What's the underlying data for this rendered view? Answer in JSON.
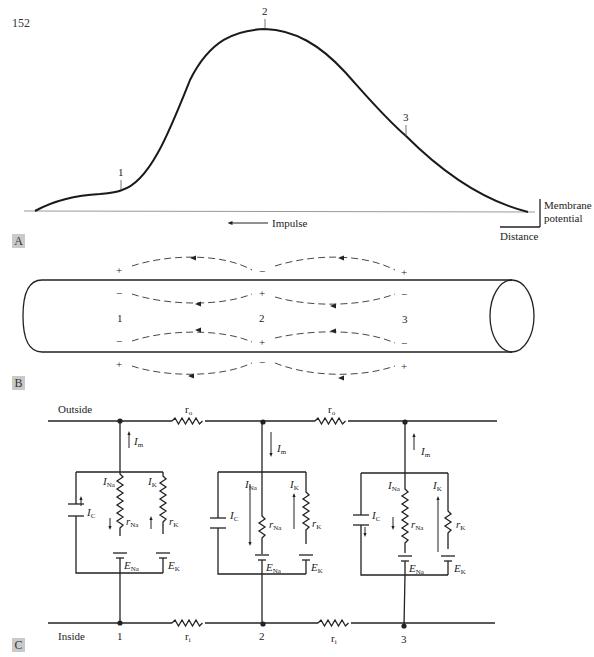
{
  "page": {
    "number": "152"
  },
  "panelA": {
    "tag": "A",
    "markers": [
      "1",
      "2",
      "3"
    ],
    "impulse_label": "Impulse",
    "scale_bar": {
      "y_label_line1": "Membrane",
      "y_label_line2": "potential",
      "x_label": "Distance"
    }
  },
  "panelB": {
    "tag": "B",
    "positions": [
      "1",
      "2",
      "3"
    ],
    "outer_signs_top": [
      "+",
      "−",
      "+"
    ],
    "inner_signs_top": [
      "−",
      "+",
      "−"
    ],
    "inner_signs_bottom": [
      "−",
      "+",
      "−"
    ],
    "outer_signs_bottom": [
      "+",
      "−",
      "+"
    ]
  },
  "panelC": {
    "tag": "C",
    "outside_label": "Outside",
    "inside_label": "Inside",
    "node_labels": [
      "1",
      "2",
      "3"
    ],
    "r_outside": "r",
    "r_outside_sub": "o",
    "r_inside": "r",
    "r_inside_sub": "i",
    "I_m": "I",
    "I_m_sub": "m",
    "I_Na": "I",
    "I_Na_sub": "Na",
    "I_K": "I",
    "I_K_sub": "K",
    "I_C": "I",
    "I_C_sub": "C",
    "r_Na": "r",
    "r_Na_sub": "Na",
    "r_K": "r",
    "r_K_sub": "K",
    "E_Na": "E",
    "E_Na_sub": "Na",
    "E_K": "E",
    "E_K_sub": "K",
    "units": [
      {
        "node": "1",
        "Im_direction": "up",
        "INa_direction": "down",
        "IK_direction": "up",
        "IC_direction": "up"
      },
      {
        "node": "2",
        "Im_direction": "down",
        "INa_direction": "down",
        "IK_direction": "up",
        "IC_direction": "none"
      },
      {
        "node": "3",
        "Im_direction": "up",
        "INa_direction": "down",
        "IK_direction": "up",
        "IC_direction": "down"
      }
    ]
  }
}
